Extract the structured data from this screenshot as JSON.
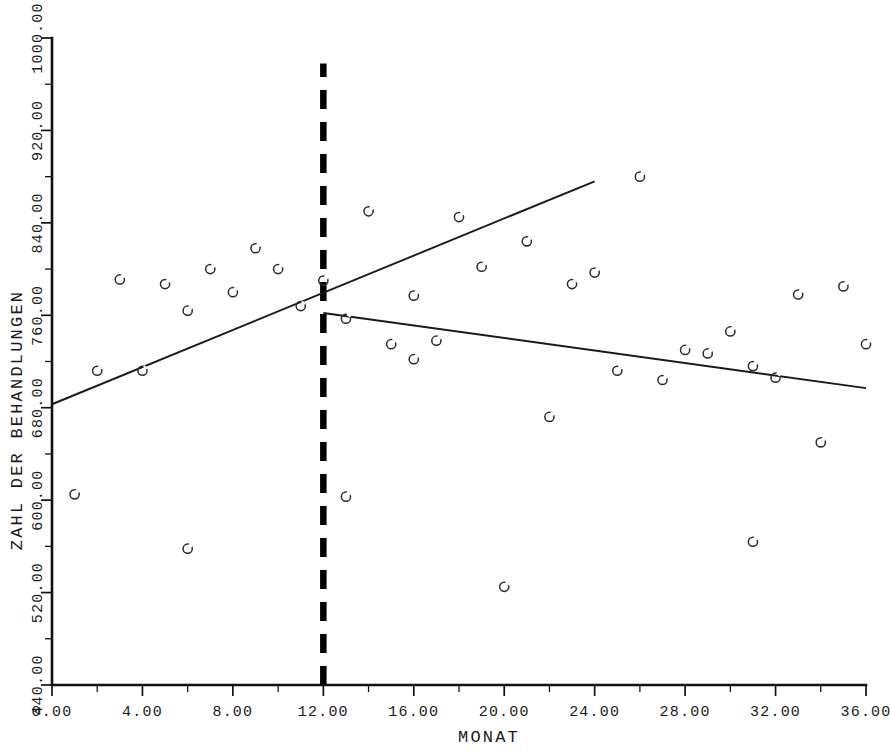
{
  "chart_data": {
    "type": "scatter",
    "title": "",
    "xlabel": "MONAT",
    "ylabel": "ZAHL DER BEHANDLUNGEN",
    "xlim": [
      0,
      36
    ],
    "ylim": [
      440,
      1000
    ],
    "xticks": [
      0,
      4,
      8,
      12,
      16,
      20,
      24,
      28,
      32,
      36
    ],
    "xtick_labels": [
      "0.00",
      "4.00",
      "8.00",
      "12.00",
      "16.00",
      "20.00",
      "24.00",
      "28.00",
      "32.00",
      "36.00"
    ],
    "yticks": [
      440,
      520,
      600,
      680,
      760,
      840,
      920,
      1000
    ],
    "ytick_labels": [
      "440.00",
      "520.00",
      "600.00",
      "680.00",
      "760.00",
      "840.00",
      "920.00",
      "1000.00"
    ],
    "minor_tick_step_x": 2,
    "minor_tick_step_y": 40,
    "grid": false,
    "legend": null,
    "marker_symbol": "open-circle",
    "x": [
      1,
      2,
      3,
      4,
      5,
      6,
      6,
      7,
      8,
      9,
      10,
      11,
      12,
      13,
      13,
      14,
      15,
      16,
      16,
      17,
      18,
      19,
      20,
      21,
      22,
      23,
      24,
      25,
      26,
      27,
      28,
      29,
      30,
      31,
      31,
      32,
      33,
      34,
      35,
      36
    ],
    "y": [
      605,
      712,
      791,
      712,
      787,
      764,
      558,
      800,
      780,
      818,
      800,
      768,
      790,
      603,
      757,
      850,
      735,
      722,
      777,
      738,
      845,
      802,
      525,
      824,
      672,
      787,
      797,
      712,
      880,
      704,
      730,
      727,
      746,
      564,
      716,
      706,
      778,
      650,
      785,
      735
    ],
    "series": [
      {
        "name": "data-points",
        "points": [
          {
            "x": 1,
            "y": 605
          },
          {
            "x": 2,
            "y": 712
          },
          {
            "x": 3,
            "y": 791
          },
          {
            "x": 4,
            "y": 712
          },
          {
            "x": 5,
            "y": 787
          },
          {
            "x": 6,
            "y": 764
          },
          {
            "x": 6,
            "y": 558
          },
          {
            "x": 7,
            "y": 800
          },
          {
            "x": 8,
            "y": 780
          },
          {
            "x": 9,
            "y": 818
          },
          {
            "x": 10,
            "y": 800
          },
          {
            "x": 11,
            "y": 768
          },
          {
            "x": 12,
            "y": 790
          },
          {
            "x": 13,
            "y": 603
          },
          {
            "x": 13,
            "y": 757
          },
          {
            "x": 14,
            "y": 850
          },
          {
            "x": 15,
            "y": 735
          },
          {
            "x": 16,
            "y": 722
          },
          {
            "x": 16,
            "y": 777
          },
          {
            "x": 17,
            "y": 738
          },
          {
            "x": 18,
            "y": 845
          },
          {
            "x": 19,
            "y": 802
          },
          {
            "x": 20,
            "y": 525
          },
          {
            "x": 21,
            "y": 824
          },
          {
            "x": 22,
            "y": 672
          },
          {
            "x": 23,
            "y": 787
          },
          {
            "x": 24,
            "y": 797
          },
          {
            "x": 25,
            "y": 712
          },
          {
            "x": 26,
            "y": 880
          },
          {
            "x": 27,
            "y": 704
          },
          {
            "x": 28,
            "y": 730
          },
          {
            "x": 29,
            "y": 727
          },
          {
            "x": 30,
            "y": 746
          },
          {
            "x": 31,
            "y": 564
          },
          {
            "x": 31,
            "y": 716
          },
          {
            "x": 32,
            "y": 706
          },
          {
            "x": 33,
            "y": 778
          },
          {
            "x": 34,
            "y": 650
          },
          {
            "x": 35,
            "y": 785
          },
          {
            "x": 36,
            "y": 735
          }
        ]
      }
    ],
    "trend_lines": [
      {
        "name": "pre-intervention-regression",
        "x_start": 0,
        "y_start": 683,
        "x_end": 24,
        "y_end": 876
      },
      {
        "name": "post-intervention-regression",
        "x_start": 12,
        "y_start": 762,
        "x_end": 36,
        "y_end": 697
      }
    ],
    "reference_lines": [
      {
        "name": "intervention-marker",
        "orientation": "vertical",
        "x": 12,
        "style": "dashed",
        "y_from": 440,
        "y_to": 978
      }
    ]
  }
}
